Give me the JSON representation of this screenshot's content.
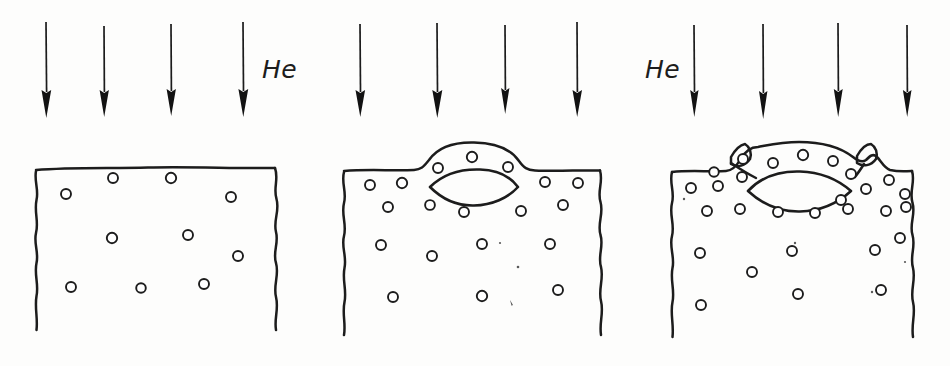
{
  "figure": {
    "background_color": "#fdfdfc",
    "ink_color": "#1c1c1c",
    "style": "hand-drawn line sketch"
  },
  "labels": {
    "gas_left": "He",
    "gas_right": "He"
  },
  "panels": [
    {
      "name": "stage-1-bubbles",
      "caption": "",
      "surface": "flat",
      "arrows": [
        {
          "x": 46,
          "y_top": 22,
          "y_tip": 112
        },
        {
          "x": 104,
          "y_top": 26,
          "y_tip": 112
        },
        {
          "x": 171,
          "y_top": 24,
          "y_tip": 111
        },
        {
          "x": 243,
          "y_top": 22,
          "y_tip": 113
        }
      ],
      "label": "He",
      "label_x": 265,
      "label_y": 78,
      "bubbles": [
        {
          "x": 113,
          "y": 178,
          "r": 5.0
        },
        {
          "x": 171,
          "y": 178,
          "r": 5.2
        },
        {
          "x": 66,
          "y": 194,
          "r": 5.0
        },
        {
          "x": 231,
          "y": 197,
          "r": 5.0
        },
        {
          "x": 112,
          "y": 238,
          "r": 5.2
        },
        {
          "x": 188,
          "y": 235,
          "r": 5.0
        },
        {
          "x": 238,
          "y": 256,
          "r": 5.0
        },
        {
          "x": 71,
          "y": 287,
          "r": 5.0
        },
        {
          "x": 141,
          "y": 288,
          "r": 4.8
        },
        {
          "x": 204,
          "y": 284,
          "r": 5.0
        }
      ],
      "bubble_count": 10,
      "void": null,
      "notches": 0
    },
    {
      "name": "stage-2-blister",
      "caption": "",
      "surface": "domed",
      "arrows": [
        {
          "x": 360,
          "y_top": 24,
          "y_tip": 112
        },
        {
          "x": 437,
          "y_top": 23,
          "y_tip": 112
        },
        {
          "x": 505,
          "y_top": 25,
          "y_tip": 109
        },
        {
          "x": 577,
          "y_top": 22,
          "y_tip": 112
        }
      ],
      "label": null,
      "bubbles": [
        {
          "x": 472,
          "y": 157,
          "r": 5.2
        },
        {
          "x": 438,
          "y": 168,
          "r": 5.0
        },
        {
          "x": 508,
          "y": 167,
          "r": 5.0
        },
        {
          "x": 370,
          "y": 185,
          "r": 5.0
        },
        {
          "x": 402,
          "y": 183,
          "r": 5.2
        },
        {
          "x": 545,
          "y": 182,
          "r": 5.0
        },
        {
          "x": 578,
          "y": 183,
          "r": 5.0
        },
        {
          "x": 388,
          "y": 207,
          "r": 5.0
        },
        {
          "x": 430,
          "y": 205,
          "r": 4.9
        },
        {
          "x": 464,
          "y": 212,
          "r": 5.0
        },
        {
          "x": 521,
          "y": 211,
          "r": 5.0
        },
        {
          "x": 563,
          "y": 205,
          "r": 5.0
        },
        {
          "x": 381,
          "y": 245,
          "r": 5.0
        },
        {
          "x": 432,
          "y": 256,
          "r": 5.0
        },
        {
          "x": 482,
          "y": 244,
          "r": 5.0
        },
        {
          "x": 550,
          "y": 244,
          "r": 5.0
        },
        {
          "x": 393,
          "y": 297,
          "r": 5.0
        },
        {
          "x": 482,
          "y": 296,
          "r": 5.2
        },
        {
          "x": 558,
          "y": 290,
          "r": 5.0
        }
      ],
      "bubble_count": 19,
      "void": {
        "left_x": 430,
        "right_x": 518,
        "center_y": 187,
        "half_height": 16
      },
      "notches": 0
    },
    {
      "name": "stage-3-blister-rupture",
      "caption": "",
      "surface": "domed-with-flake-notches",
      "arrows": [
        {
          "x": 694,
          "y_top": 25,
          "y_tip": 112
        },
        {
          "x": 763,
          "y_top": 24,
          "y_tip": 114
        },
        {
          "x": 838,
          "y_top": 23,
          "y_tip": 112
        },
        {
          "x": 907,
          "y_top": 25,
          "y_tip": 112
        }
      ],
      "label": "He",
      "label_x": 650,
      "label_y": 78,
      "bubbles": [
        {
          "x": 803,
          "y": 155,
          "r": 5.2
        },
        {
          "x": 773,
          "y": 163,
          "r": 5.0
        },
        {
          "x": 833,
          "y": 161,
          "r": 5.0
        },
        {
          "x": 743,
          "y": 160,
          "r": 5.0
        },
        {
          "x": 714,
          "y": 172,
          "r": 4.8
        },
        {
          "x": 742,
          "y": 177,
          "r": 5.0
        },
        {
          "x": 851,
          "y": 174,
          "r": 5.0
        },
        {
          "x": 889,
          "y": 180,
          "r": 5.0
        },
        {
          "x": 691,
          "y": 188,
          "r": 5.0
        },
        {
          "x": 718,
          "y": 186,
          "r": 5.0
        },
        {
          "x": 866,
          "y": 189,
          "r": 5.0
        },
        {
          "x": 905,
          "y": 194,
          "r": 5.0
        },
        {
          "x": 841,
          "y": 200,
          "r": 5.0
        },
        {
          "x": 906,
          "y": 207,
          "r": 5.0
        },
        {
          "x": 707,
          "y": 211,
          "r": 5.0
        },
        {
          "x": 740,
          "y": 209,
          "r": 5.0
        },
        {
          "x": 778,
          "y": 212,
          "r": 5.0
        },
        {
          "x": 815,
          "y": 213,
          "r": 5.0
        },
        {
          "x": 848,
          "y": 209,
          "r": 5.0
        },
        {
          "x": 886,
          "y": 211,
          "r": 5.0
        },
        {
          "x": 700,
          "y": 253,
          "r": 5.0
        },
        {
          "x": 792,
          "y": 251,
          "r": 5.0
        },
        {
          "x": 875,
          "y": 250,
          "r": 5.0
        },
        {
          "x": 900,
          "y": 238,
          "r": 5.0
        },
        {
          "x": 752,
          "y": 272,
          "r": 5.0
        },
        {
          "x": 798,
          "y": 294,
          "r": 5.0
        },
        {
          "x": 881,
          "y": 290,
          "r": 5.0
        },
        {
          "x": 701,
          "y": 305,
          "r": 5.0
        }
      ],
      "bubble_count": 28,
      "void": {
        "left_x": 750,
        "right_x": 850,
        "center_y": 190,
        "half_height": 18
      },
      "notches": 2
    }
  ],
  "geometry": {
    "canvas_width": 950,
    "canvas_height": 366,
    "arrow_count_total": 12,
    "panel_count": 3
  }
}
